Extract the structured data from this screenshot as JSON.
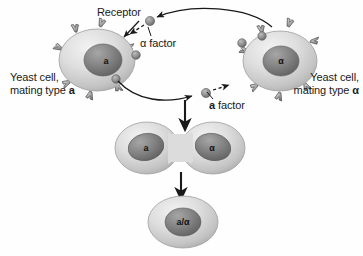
{
  "figure": {
    "background_color": "#fefefe"
  },
  "labels": {
    "receptor": "Receptor",
    "alpha_factor": "α factor",
    "a_factor_prefix": "a",
    "a_factor_suffix": " factor",
    "left_cell_line1": "Yeast cell,",
    "left_cell_line2_prefix": "mating type ",
    "left_cell_line2_type": "a",
    "right_cell_line1": "Yeast cell,",
    "right_cell_line2_prefix": "mating type ",
    "right_cell_line2_type": "α"
  },
  "cells": {
    "left": {
      "nucleus_label": "a",
      "name": "yeast-cell-type-a"
    },
    "right": {
      "nucleus_label": "α",
      "name": "yeast-cell-type-alpha"
    },
    "fused_left": {
      "nucleus_label": "a"
    },
    "fused_right": {
      "nucleus_label": "α"
    },
    "zygote": {
      "nucleus_label": "a/α"
    }
  },
  "colors": {
    "cell_body_light": "#e4e4e4",
    "cell_body_mid": "#cfcfcf",
    "cell_body_dark": "#b3b3b3",
    "nucleus_light": "#9a9a9a",
    "nucleus_dark": "#6b6b6b",
    "receptor_gray": "#a8a8a8",
    "receptor_outline": "#4a4a4a",
    "ligand_gray": "#8f8f8f",
    "arrow_black": "#1a1a1a",
    "text_black": "#1a1a1a"
  },
  "arrows": {
    "alpha_path_description": "curved arrow from alpha cell to a cell receptor",
    "a_path_description": "curved arrow from a cell to alpha cell receptor",
    "step1_description": "downward arrow to fused cell",
    "step2_description": "downward arrow to zygote"
  }
}
